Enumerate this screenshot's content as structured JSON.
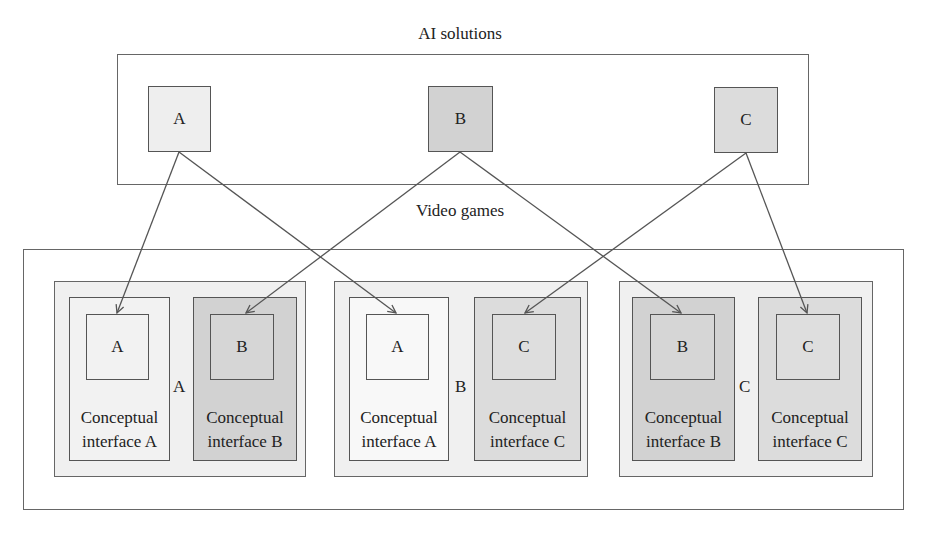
{
  "top": {
    "title": "AI solutions",
    "boxes": [
      {
        "label": "A",
        "fill": "#eeeeee"
      },
      {
        "label": "B",
        "fill": "#d2d2d2"
      },
      {
        "label": "C",
        "fill": "#dcdcdc"
      }
    ]
  },
  "bottom": {
    "title": "Video games",
    "groups": [
      {
        "label": "A",
        "panels": [
          {
            "box": "A",
            "line1": "Conceptual",
            "line2": "interface A",
            "fill": "#f2f2f2",
            "boxFill": "#f2f2f2"
          },
          {
            "box": "B",
            "line1": "Conceptual",
            "line2": "interface B",
            "fill": "#d2d2d2",
            "boxFill": "#d6d6d6"
          }
        ]
      },
      {
        "label": "B",
        "panels": [
          {
            "box": "A",
            "line1": "Conceptual",
            "line2": "interface A",
            "fill": "#f8f8f8",
            "boxFill": "#f8f8f8"
          },
          {
            "box": "C",
            "line1": "Conceptual",
            "line2": "interface C",
            "fill": "#dcdcdc",
            "boxFill": "#dedede"
          }
        ]
      },
      {
        "label": "C",
        "panels": [
          {
            "box": "B",
            "line1": "Conceptual",
            "line2": "interface B",
            "fill": "#d2d2d2",
            "boxFill": "#d6d6d6"
          },
          {
            "box": "C",
            "line1": "Conceptual",
            "line2": "interface C",
            "fill": "#dcdcdc",
            "boxFill": "#dedede"
          }
        ]
      }
    ]
  },
  "colors": {
    "line": "#555555",
    "groupBg": "#f0f0f0"
  }
}
